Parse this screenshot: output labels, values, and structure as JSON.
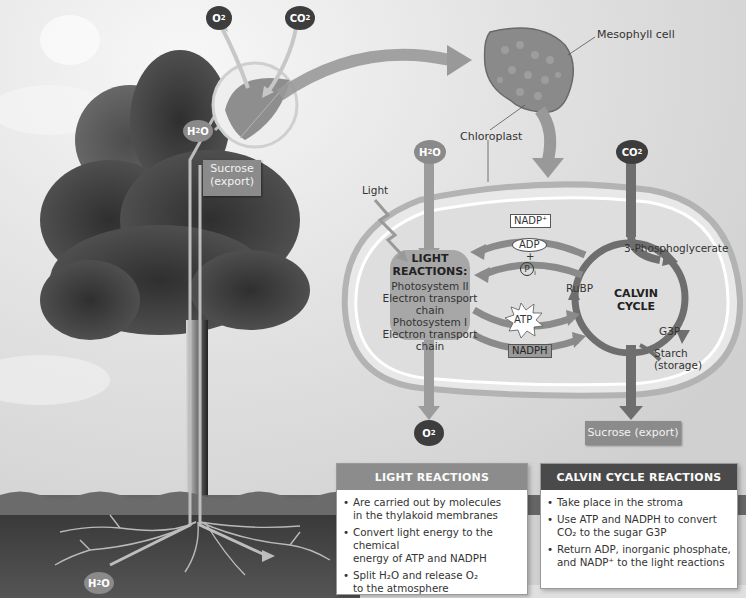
{
  "figure": {
    "atmosphere": {
      "o2_label": "O",
      "o2_sub": "2",
      "co2_label": "CO",
      "co2_sub": "2"
    },
    "leaf": {
      "h2o_label": "H",
      "h2o_sub": "2",
      "h2o_suffix": "O",
      "sucrose_line1": "Sucrose",
      "sucrose_line2": "(export)"
    },
    "roots": {
      "h2o_label": "H",
      "h2o_sub": "2",
      "h2o_suffix": "O"
    },
    "cell": {
      "mesophyll_label": "Mesophyll cell",
      "chloroplast_label": "Chloroplast"
    },
    "chloroplast": {
      "inputs": {
        "h2o_label": "H",
        "h2o_sub": "2",
        "h2o_suffix": "O",
        "co2_label": "CO",
        "co2_sub": "2",
        "light_label": "Light"
      },
      "light_reactions": {
        "title_line1": "LIGHT",
        "title_line2": "REACTIONS:",
        "components": [
          "Photosystem II",
          "Electron transport chain",
          "Photosystem I",
          "Electron transport chain"
        ]
      },
      "carriers": {
        "nadp": "NADP⁺",
        "adp": "ADP",
        "plus": "+",
        "pi": "P",
        "pi_sub": "i",
        "atp": "ATP",
        "nadph": "NADPH"
      },
      "calvin_cycle": {
        "title_line1": "CALVIN",
        "title_line2": "CYCLE",
        "rubp": "RuBP",
        "pga": "3-Phosphoglycerate",
        "g3p": "G3P",
        "starch_line1": "Starch",
        "starch_line2": "(storage)"
      },
      "outputs": {
        "o2_label": "O",
        "o2_sub": "2",
        "sucrose": "Sucrose (export)"
      }
    },
    "panels": {
      "light": {
        "title": "LIGHT REACTIONS",
        "header_color": "#8c8c8c",
        "bullets": [
          {
            "text_a": "Are carried out by molecules",
            "text_b": "in the thylakoid membranes"
          },
          {
            "text_a": "Convert light energy to the chemical",
            "text_b": "energy of ATP and NADPH"
          },
          {
            "text_a": "Split H₂O and release O₂",
            "text_b": "to the atmosphere"
          }
        ]
      },
      "calvin": {
        "title": "CALVIN CYCLE REACTIONS",
        "header_color": "#4a4a4a",
        "bullets": [
          {
            "text_a": "Take place in the stroma",
            "text_b": ""
          },
          {
            "text_a": "Use ATP and NADPH to convert",
            "text_b": "CO₂ to the sugar G3P"
          },
          {
            "text_a": "Return ADP, inorganic phosphate,",
            "text_b": "and NADP⁺ to the light reactions"
          }
        ]
      }
    }
  }
}
